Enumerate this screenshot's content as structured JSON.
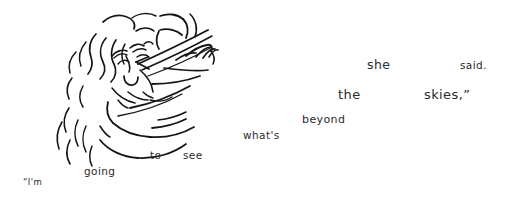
{
  "artwork": {
    "title": "hand-drawn line sketch of a face with flowing hair and a gesturing hand",
    "style": "ink line drawing",
    "background_color": "#ffffff",
    "ink_color": "#151515"
  },
  "text": {
    "full_sentence": "\"I'm going to see what's beyond the skies,\" she said.",
    "color": "#2b2b2b",
    "words": [
      {
        "label": "“I'm",
        "x": 23,
        "y": 178,
        "size": 8.5
      },
      {
        "label": "going",
        "x": 84,
        "y": 166,
        "size": 10.5
      },
      {
        "label": "to",
        "x": 150,
        "y": 150,
        "size": 10.5
      },
      {
        "label": "see",
        "x": 183,
        "y": 150,
        "size": 10.5
      },
      {
        "label": "what's",
        "x": 243,
        "y": 130,
        "size": 10.5
      },
      {
        "label": "beyond",
        "x": 302,
        "y": 114,
        "size": 11
      },
      {
        "label": "the",
        "x": 338,
        "y": 88,
        "size": 13
      },
      {
        "label": "skies,”",
        "x": 424,
        "y": 88,
        "size": 13
      },
      {
        "label": "she",
        "x": 367,
        "y": 59,
        "size": 12.5
      },
      {
        "label": "said.",
        "x": 460,
        "y": 60,
        "size": 10.5
      }
    ]
  }
}
